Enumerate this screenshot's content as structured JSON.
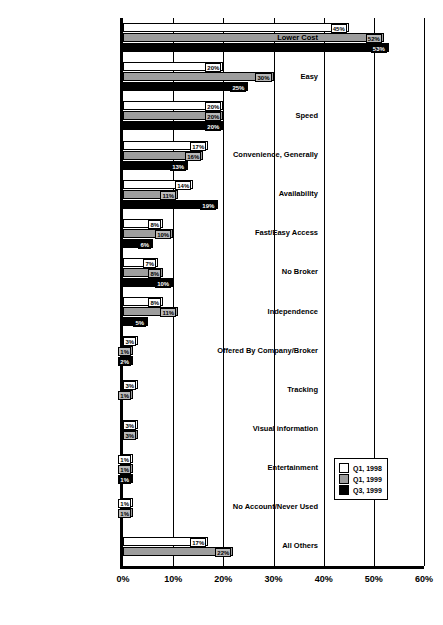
{
  "chart_data": {
    "type": "bar",
    "orientation": "horizontal",
    "title": "",
    "subtitle": "",
    "xlabel": "",
    "ylabel": "",
    "xlim": [
      0,
      60
    ],
    "xunit": "%",
    "grid": true,
    "legend_position": "right-lower",
    "xticks": [
      "0%",
      "10%",
      "20%",
      "30%",
      "40%",
      "50%",
      "60%"
    ],
    "xtick_values": [
      0,
      10,
      20,
      30,
      40,
      50,
      60
    ],
    "categories": [
      "Lower Cost",
      "Easy",
      "Speed",
      "Convenience, Generally",
      "Availability",
      "Fast/Easy Access",
      "No Broker",
      "Independence",
      "Offered By Company/Broker",
      "Tracking",
      "Visual information",
      "Entertainment",
      "No Account/Never Used",
      "All Others"
    ],
    "series": [
      {
        "name": "Q1, 1998",
        "color": "#ffffff",
        "values": [
          45,
          20,
          20,
          17,
          14,
          8,
          7,
          8,
          3,
          3,
          3,
          1,
          1,
          17
        ],
        "labels": [
          "45%",
          "20%",
          "20%",
          "17%",
          "14%",
          "8%",
          "7%",
          "8%",
          "3%",
          "3%",
          "3%",
          "1%",
          "1%",
          "17%"
        ]
      },
      {
        "name": "Q1, 1999",
        "color": "#9d9d9d",
        "values": [
          52,
          30,
          20,
          16,
          11,
          10,
          8,
          11,
          1,
          1,
          3,
          1,
          1,
          22
        ],
        "labels": [
          "52%",
          "30%",
          "20%",
          "16%",
          "11%",
          "10%",
          "8%",
          "11%",
          "1%",
          "1%",
          "3%",
          "1%",
          "1%",
          "22%"
        ]
      },
      {
        "name": "Q3, 1999",
        "color": "#000000",
        "values": [
          53,
          25,
          20,
          13,
          19,
          6,
          10,
          5,
          2,
          null,
          null,
          1,
          null,
          null
        ],
        "labels": [
          "53%",
          "25%",
          "20%",
          "13%",
          "19%",
          "6%",
          "10%",
          "5%",
          "2%",
          null,
          null,
          "1%",
          null,
          null
        ]
      }
    ]
  },
  "legend": {
    "items": [
      {
        "label": "Q1, 1998",
        "swatch": "white-swatch"
      },
      {
        "label": "Q1, 1999",
        "swatch": "grey-swatch"
      },
      {
        "label": "Q3, 1999",
        "swatch": "black-swatch"
      }
    ]
  }
}
